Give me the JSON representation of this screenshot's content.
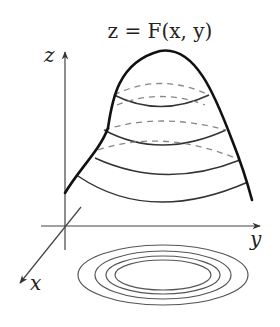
{
  "diagram": {
    "title": "z = F(x, y)",
    "axes": {
      "z_label": "z",
      "x_label": "x",
      "y_label": "y"
    },
    "surface": {
      "description": "paraboloid-like surface above xy-plane",
      "level_curves_on_surface": 4
    },
    "contour_map": {
      "description": "nested elliptical level curves projected on xy-plane",
      "count": 4
    },
    "colors": {
      "stroke": "#222222",
      "dashed": "#888888",
      "background": "#ffffff"
    }
  }
}
